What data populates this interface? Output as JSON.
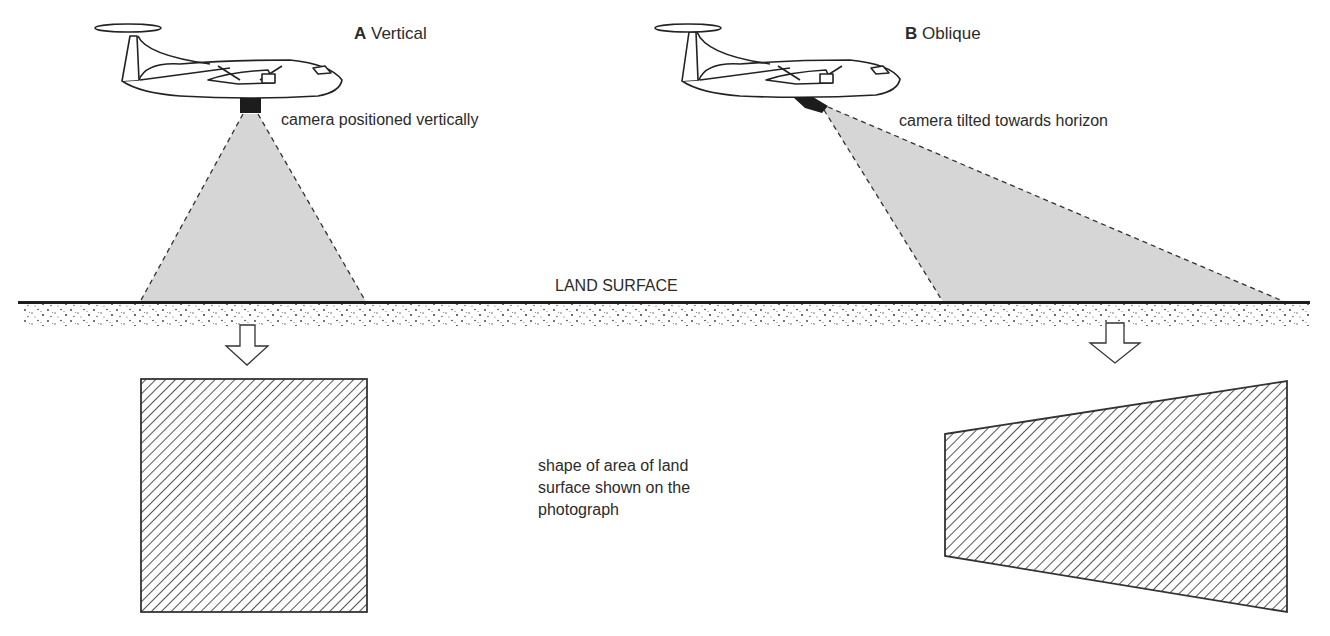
{
  "diagram": {
    "panel_a": {
      "letter": "A",
      "title": "Vertical",
      "camera_label": "camera positioned vertically"
    },
    "panel_b": {
      "letter": "B",
      "title": "Oblique",
      "camera_label": "camera tilted towards horizon"
    },
    "ground_label": "LAND SURFACE",
    "caption": {
      "line1": "shape of area of land",
      "line2": "surface shown on the",
      "line3": "photograph"
    },
    "colors": {
      "beam_fill": "#d6d6d6",
      "line": "#2a2a2a",
      "camera": "#1c1c1c",
      "hatch": "#555555"
    }
  }
}
